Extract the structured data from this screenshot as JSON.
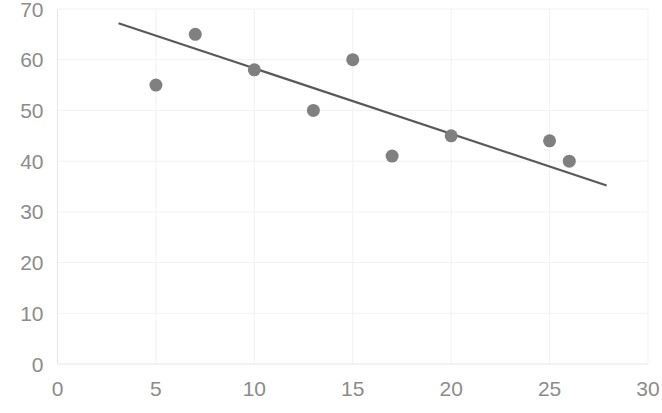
{
  "chart_data": {
    "type": "scatter",
    "title": "",
    "subtitle": "",
    "xlabel": "",
    "ylabel": "",
    "xlim": [
      0,
      30
    ],
    "ylim": [
      0,
      70
    ],
    "x_ticks": [
      0,
      5,
      10,
      15,
      20,
      25,
      30
    ],
    "y_ticks": [
      0,
      10,
      20,
      30,
      40,
      50,
      60,
      70
    ],
    "x_tick_labels": [
      "0",
      "5",
      "10",
      "15",
      "20",
      "25",
      "30"
    ],
    "y_tick_labels": [
      "0",
      "10",
      "20",
      "30",
      "40",
      "50",
      "60",
      "70"
    ],
    "grid": true,
    "legend": "none",
    "series": [
      {
        "name": "data points",
        "type": "scatter",
        "marker_color": "#808080",
        "marker_size": 13,
        "points": [
          {
            "x": 5,
            "y": 55
          },
          {
            "x": 7,
            "y": 65
          },
          {
            "x": 10,
            "y": 58
          },
          {
            "x": 13,
            "y": 50
          },
          {
            "x": 15,
            "y": 60
          },
          {
            "x": 17,
            "y": 41
          },
          {
            "x": 20,
            "y": 45
          },
          {
            "x": 25,
            "y": 44
          },
          {
            "x": 26,
            "y": 40
          }
        ]
      },
      {
        "name": "trend line",
        "type": "line",
        "line_color": "#595959",
        "endpoints": [
          {
            "x": 3.1,
            "y": 67.2
          },
          {
            "x": 27.9,
            "y": 35.2
          }
        ]
      }
    ],
    "colors": {
      "marker": "#808080",
      "trend_line": "#595959",
      "gridline": "#f2f2f2",
      "axis_line": "#e6e6e6",
      "tick_label": "#8c8c8c",
      "background": "#ffffff"
    }
  }
}
